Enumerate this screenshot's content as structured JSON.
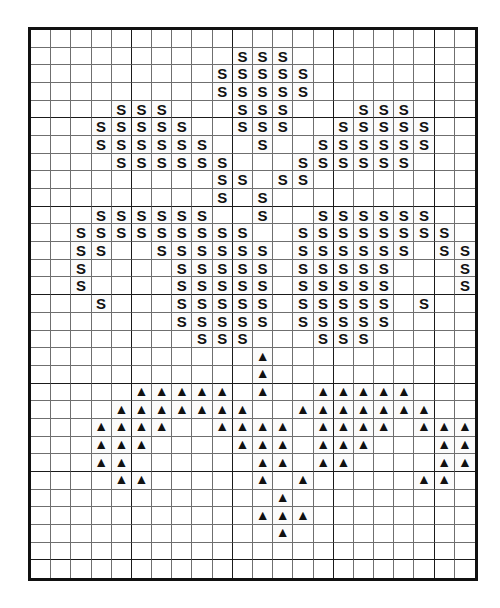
{
  "chart_data": {
    "type": "heatmap",
    "xlabel": "",
    "ylabel": "",
    "grid": true,
    "legend_position": "none",
    "columns": 22,
    "rows": 28,
    "major_gridline_interval": 5,
    "symbols": {
      "S": "S",
      "T": "▲",
      "empty": ""
    },
    "symbol_names": {
      "S": "letter-s-stitch",
      "T": "filled-triangle-stitch"
    },
    "colors": {
      "background": "#ffffff",
      "minor_gridline": "#6f6f6f",
      "major_gridline": "#1a1a1a",
      "border": "#111111",
      "symbol": "#111111"
    },
    "cells": [
      [
        "",
        "",
        "",
        "",
        "",
        "",
        "",
        "",
        "",
        "",
        "",
        "",
        "",
        "",
        "",
        "",
        "",
        "",
        "",
        "",
        "",
        ""
      ],
      [
        "",
        "",
        "",
        "",
        "",
        "",
        "",
        "",
        "",
        "",
        "S",
        "S",
        "S",
        "",
        "",
        "",
        "",
        "",
        "",
        "",
        "",
        ""
      ],
      [
        "",
        "",
        "",
        "",
        "",
        "",
        "",
        "",
        "",
        "S",
        "S",
        "S",
        "S",
        "S",
        "",
        "",
        "",
        "",
        "",
        "",
        "",
        ""
      ],
      [
        "",
        "",
        "",
        "",
        "",
        "",
        "",
        "",
        "",
        "S",
        "S",
        "S",
        "S",
        "S",
        "",
        "",
        "",
        "",
        "",
        "",
        "",
        ""
      ],
      [
        "",
        "",
        "",
        "",
        "S",
        "S",
        "S",
        "",
        "",
        "",
        "S",
        "S",
        "S",
        "",
        "",
        "",
        "S",
        "S",
        "S",
        "",
        "",
        ""
      ],
      [
        "",
        "",
        "",
        "S",
        "S",
        "S",
        "S",
        "S",
        "",
        "",
        "S",
        "S",
        "S",
        "",
        "",
        "S",
        "S",
        "S",
        "S",
        "S",
        "",
        ""
      ],
      [
        "",
        "",
        "",
        "S",
        "S",
        "S",
        "S",
        "S",
        "S",
        "",
        "",
        "S",
        "",
        "",
        "S",
        "S",
        "S",
        "S",
        "S",
        "S",
        "",
        ""
      ],
      [
        "",
        "",
        "",
        "",
        "S",
        "S",
        "S",
        "S",
        "S",
        "S",
        "",
        "",
        "",
        "S",
        "S",
        "S",
        "S",
        "S",
        "S",
        "",
        "",
        ""
      ],
      [
        "",
        "",
        "",
        "",
        "",
        "",
        "",
        "",
        "",
        "S",
        "S",
        "",
        "S",
        "S",
        "",
        "",
        "",
        "",
        "",
        "",
        "",
        ""
      ],
      [
        "",
        "",
        "",
        "",
        "",
        "",
        "",
        "",
        "",
        "S",
        "",
        "S",
        "",
        "",
        "",
        "",
        "",
        "",
        "",
        "",
        "",
        ""
      ],
      [
        "",
        "",
        "",
        "S",
        "S",
        "S",
        "S",
        "S",
        "S",
        "",
        "",
        "S",
        "",
        "",
        "S",
        "S",
        "S",
        "S",
        "S",
        "S",
        "",
        ""
      ],
      [
        "",
        "",
        "S",
        "S",
        "S",
        "S",
        "S",
        "S",
        "S",
        "S",
        "S",
        "",
        "",
        "S",
        "S",
        "S",
        "S",
        "S",
        "S",
        "S",
        "S",
        ""
      ],
      [
        "",
        "",
        "S",
        "S",
        "",
        "",
        "S",
        "S",
        "S",
        "S",
        "S",
        "S",
        "",
        "S",
        "S",
        "S",
        "S",
        "S",
        "S",
        "",
        "S",
        "S"
      ],
      [
        "",
        "",
        "S",
        "",
        "",
        "",
        "",
        "S",
        "S",
        "S",
        "S",
        "S",
        "",
        "S",
        "S",
        "S",
        "S",
        "S",
        "",
        "",
        "",
        "S"
      ],
      [
        "",
        "",
        "S",
        "",
        "",
        "",
        "",
        "S",
        "S",
        "S",
        "S",
        "S",
        "",
        "S",
        "S",
        "S",
        "S",
        "S",
        "",
        "",
        "",
        "S"
      ],
      [
        "",
        "",
        "",
        "S",
        "",
        "",
        "",
        "S",
        "S",
        "S",
        "S",
        "S",
        "",
        "S",
        "S",
        "S",
        "S",
        "S",
        "",
        "S",
        "",
        ""
      ],
      [
        "",
        "",
        "",
        "",
        "",
        "",
        "",
        "S",
        "S",
        "S",
        "S",
        "S",
        "",
        "S",
        "S",
        "S",
        "S",
        "S",
        "",
        "",
        "",
        ""
      ],
      [
        "",
        "",
        "",
        "",
        "",
        "",
        "",
        "",
        "S",
        "S",
        "S",
        "",
        "",
        "",
        "S",
        "S",
        "S",
        "",
        "",
        "",
        "",
        ""
      ],
      [
        "",
        "",
        "",
        "",
        "",
        "",
        "",
        "",
        "",
        "",
        "",
        "T",
        "",
        "",
        "",
        "",
        "",
        "",
        "",
        "",
        "",
        ""
      ],
      [
        "",
        "",
        "",
        "",
        "",
        "",
        "",
        "",
        "",
        "",
        "",
        "T",
        "",
        "",
        "",
        "",
        "",
        "",
        "",
        "",
        "",
        ""
      ],
      [
        "",
        "",
        "",
        "",
        "",
        "T",
        "T",
        "T",
        "T",
        "T",
        "",
        "T",
        "",
        "",
        "T",
        "T",
        "T",
        "T",
        "T",
        "",
        "",
        ""
      ],
      [
        "",
        "",
        "",
        "",
        "T",
        "T",
        "T",
        "T",
        "T",
        "T",
        "T",
        "",
        "",
        "T",
        "T",
        "T",
        "T",
        "T",
        "T",
        "T",
        "",
        ""
      ],
      [
        "",
        "",
        "",
        "T",
        "T",
        "T",
        "T",
        "",
        "",
        "T",
        "T",
        "T",
        "T",
        "",
        "T",
        "T",
        "T",
        "T",
        "",
        "T",
        "T",
        "T"
      ],
      [
        "",
        "",
        "",
        "T",
        "T",
        "T",
        "",
        "",
        "",
        "",
        "T",
        "T",
        "T",
        "",
        "T",
        "T",
        "T",
        "",
        "",
        "",
        "T",
        "T"
      ],
      [
        "",
        "",
        "",
        "T",
        "T",
        "",
        "",
        "",
        "",
        "",
        "",
        "T",
        "T",
        "",
        "T",
        "T",
        "",
        "",
        "",
        "",
        "T",
        "T"
      ],
      [
        "",
        "",
        "",
        "",
        "T",
        "T",
        "",
        "",
        "",
        "",
        "",
        "T",
        "",
        "T",
        "",
        "",
        "",
        "",
        "",
        "T",
        "T",
        ""
      ],
      [
        "",
        "",
        "",
        "",
        "",
        "",
        "",
        "",
        "",
        "",
        "",
        "",
        "T",
        "",
        "",
        "",
        "",
        "",
        "",
        "",
        "",
        ""
      ],
      [
        "",
        "",
        "",
        "",
        "",
        "",
        "",
        "",
        "",
        "",
        "",
        "T",
        "T",
        "T",
        "",
        "",
        "",
        "",
        "",
        "",
        "",
        ""
      ],
      [
        "",
        "",
        "",
        "",
        "",
        "",
        "",
        "",
        "",
        "",
        "",
        "",
        "T",
        "",
        "",
        "",
        "",
        "",
        "",
        "",
        "",
        ""
      ],
      [
        "",
        "",
        "",
        "",
        "",
        "",
        "",
        "",
        "",
        "",
        "",
        "",
        "",
        "",
        "",
        "",
        "",
        "",
        "",
        "",
        "",
        ""
      ],
      [
        "",
        "",
        "",
        "",
        "",
        "",
        "",
        "",
        "",
        "",
        "",
        "",
        "",
        "",
        "",
        "",
        "",
        "",
        "",
        "",
        "",
        ""
      ]
    ]
  }
}
